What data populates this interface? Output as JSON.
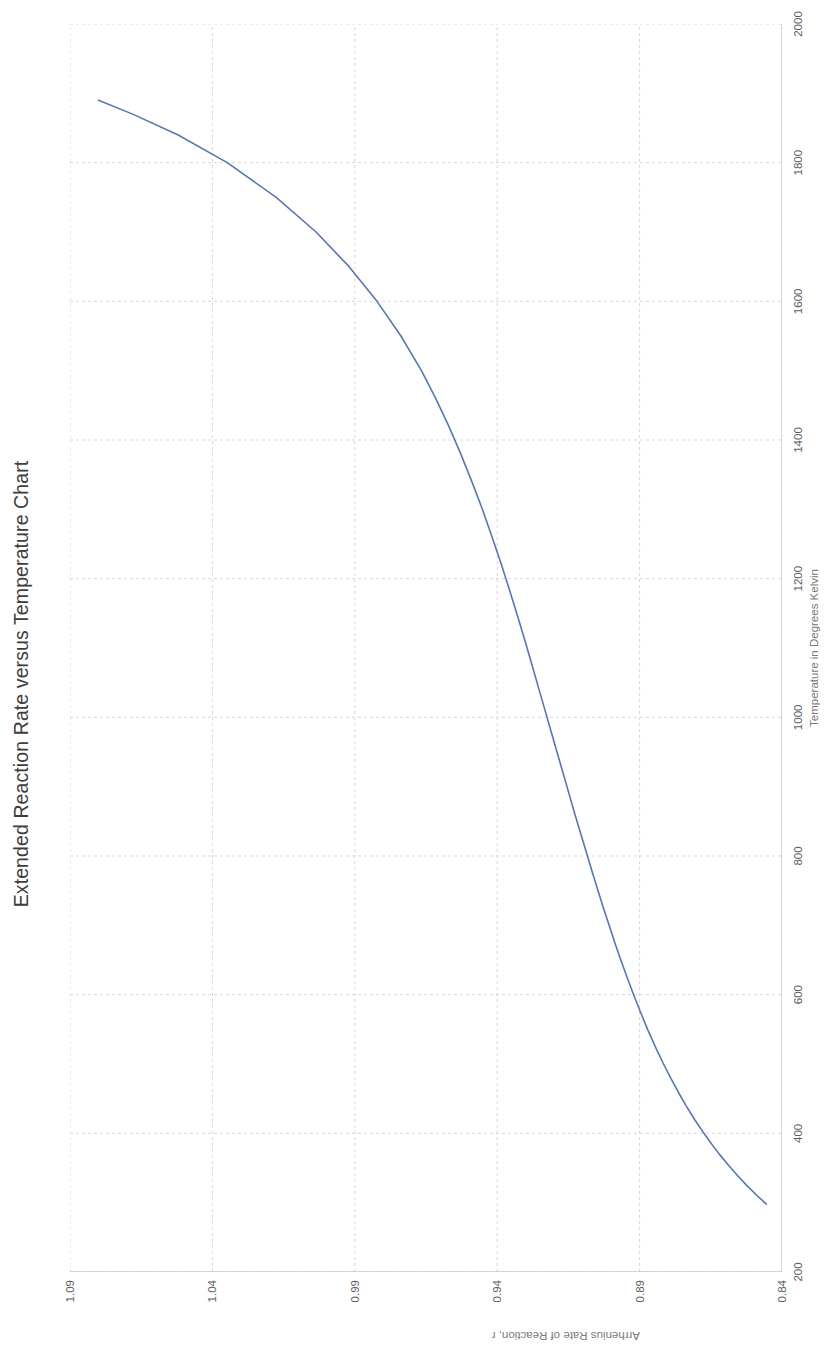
{
  "chart_data": {
    "type": "line",
    "title": "Extended Reaction Rate versus Temperature Chart",
    "xlabel": "Temperature in Degrees Kelvin",
    "ylabel": "Arrhenius Rate of Reaction, r",
    "xlim": [
      200,
      2000
    ],
    "ylim": [
      0.84,
      1.09
    ],
    "xticks": [
      200,
      400,
      600,
      800,
      1000,
      1200,
      1400,
      1600,
      1800,
      2000
    ],
    "xtick_labels": [
      "200",
      "400",
      "600",
      "800",
      "1000",
      "1200",
      "1400",
      "1600",
      "1800",
      "2000"
    ],
    "yticks": [
      0.84,
      0.89,
      0.94,
      0.99,
      1.04,
      1.09
    ],
    "ytick_labels": [
      "0.84",
      "0.89",
      "0.94",
      "0.99",
      "1.04",
      "1.09"
    ],
    "grid": true,
    "legend": null,
    "series": [
      {
        "name": "Arrhenius Rate of Reaction, r",
        "color": "#5877b0",
        "linewidth": 1.6,
        "x": [
          298,
          310,
          325,
          340,
          355,
          370,
          385,
          400,
          420,
          440,
          460,
          480,
          500,
          525,
          550,
          575,
          600,
          625,
          650,
          675,
          700,
          725,
          750,
          775,
          800,
          830,
          860,
          890,
          920,
          950,
          980,
          1010,
          1040,
          1070,
          1100,
          1140,
          1180,
          1220,
          1260,
          1300,
          1340,
          1380,
          1420,
          1460,
          1500,
          1550,
          1600,
          1650,
          1700,
          1750,
          1800,
          1840,
          1870,
          1890
        ],
        "y": [
          0.8455,
          0.8487,
          0.8524,
          0.8558,
          0.859,
          0.862,
          0.8648,
          0.8674,
          0.8707,
          0.8737,
          0.8765,
          0.8791,
          0.8816,
          0.8845,
          0.8872,
          0.8897,
          0.8921,
          0.8944,
          0.8966,
          0.8987,
          0.9007,
          0.9027,
          0.9046,
          0.9065,
          0.9083,
          0.9105,
          0.9127,
          0.9148,
          0.9169,
          0.919,
          0.9211,
          0.9232,
          0.9253,
          0.9274,
          0.9295,
          0.9324,
          0.9354,
          0.9385,
          0.9418,
          0.9452,
          0.9489,
          0.9528,
          0.957,
          0.9616,
          0.9666,
          0.9738,
          0.9822,
          0.992,
          1.0036,
          1.0176,
          1.0348,
          1.052,
          1.068,
          1.08
        ]
      }
    ]
  },
  "axes": {
    "x_label": "Temperature in Degrees Kelvin",
    "y_label": "Arrhenius Rate of Reaction, r"
  },
  "title": "Extended Reaction Rate versus Temperature Chart"
}
